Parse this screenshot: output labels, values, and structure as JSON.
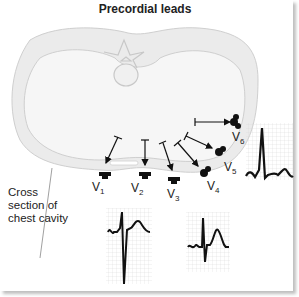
{
  "title": "Precordial leads",
  "caption": {
    "line1": "Cross",
    "line2": "section of",
    "line3": "chest cavity"
  },
  "leads": [
    {
      "id": "V1",
      "letter": "V",
      "sub": "1"
    },
    {
      "id": "V2",
      "letter": "V",
      "sub": "2"
    },
    {
      "id": "V3",
      "letter": "V",
      "sub": "3"
    },
    {
      "id": "V4",
      "letter": "V",
      "sub": "4"
    },
    {
      "id": "V5",
      "letter": "V",
      "sub": "5"
    },
    {
      "id": "V6",
      "letter": "V",
      "sub": "6"
    }
  ],
  "ecg_strips": [
    {
      "name": "ecg-strip-1",
      "description": "rS complex, deep S wave"
    },
    {
      "name": "ecg-strip-2",
      "description": "RS complex, tall T wave"
    },
    {
      "name": "ecg-strip-3",
      "description": "tall R wave, small S"
    }
  ],
  "colors": {
    "torso_fill": "#ebebeb",
    "torso_outline": "#c8c8c8",
    "electrode": "#111111",
    "ecg_grid": "#d0d0d0",
    "ecg_trace": "#111111"
  }
}
